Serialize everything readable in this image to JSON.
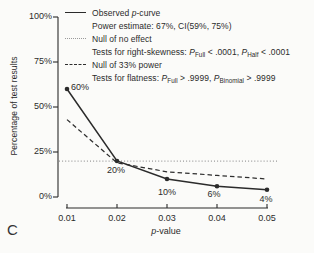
{
  "panel_label": "C",
  "legend": {
    "observed": {
      "t1": "Observed ",
      "p": "p",
      "t2": "-curve"
    },
    "power": "Power estimate: 67%, CI(59%, 75%)",
    "null_no_effect": "Null of no effect",
    "skew": {
      "t1": "Tests for right-skewness: ",
      "p1": "P",
      "s1": "Full",
      "t2": " < .0001, ",
      "p2": "P",
      "s2": "Half",
      "t3": " < .0001"
    },
    "null_33": "Null of 33% power",
    "flat": {
      "t1": "Tests for flatness: ",
      "p1": "P",
      "s1": "Full",
      "t2": " > .9999, ",
      "p2": "P",
      "s2": "Binomial",
      "t3": " > .9999"
    }
  },
  "axis": {
    "xlabel_italic": "p",
    "xlabel_rest": "-value"
  },
  "chart_data": {
    "type": "line",
    "x": [
      0.01,
      0.02,
      0.03,
      0.04,
      0.05
    ],
    "xlim": [
      0.01,
      0.05
    ],
    "ylim": [
      0,
      100
    ],
    "x_tick_labels": [
      "0.01",
      "0.02",
      "0.03",
      "0.04",
      "0.05"
    ],
    "y_tick_values": [
      0,
      25,
      50,
      75,
      100
    ],
    "y_tick_labels": [
      "0%",
      "25%",
      "50%",
      "75%",
      "100%"
    ],
    "xlabel": "p-value",
    "ylabel": "Percentage of test results",
    "grid": false,
    "legend_position": "top-left",
    "series": [
      {
        "name": "Observed p-curve",
        "values": [
          60,
          20,
          10,
          6,
          4
        ],
        "style": "solid",
        "color": "#2b2b2b",
        "markers": true,
        "full_width": false
      },
      {
        "name": "Null of no effect",
        "values": [
          20,
          20,
          20,
          20,
          20
        ],
        "style": "dotted",
        "color": "#9a9a9a",
        "markers": false,
        "full_width": true
      },
      {
        "name": "Null of 33% power",
        "values": [
          43,
          19,
          14,
          12,
          10
        ],
        "style": "dashed",
        "color": "#2e2e2e",
        "markers": false,
        "full_width": false
      }
    ],
    "point_labels": [
      "60%",
      "20%",
      "10%",
      "6%",
      "4%"
    ],
    "axis_color": "#2b2b2b"
  }
}
